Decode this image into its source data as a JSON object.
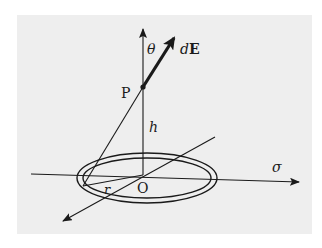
{
  "diagram": {
    "labels": {
      "point": "P",
      "origin": "O",
      "height": "h",
      "angle": "θ",
      "field_d": "d",
      "field_E": "E",
      "radius": "r",
      "charge_density": "σ"
    },
    "colors": {
      "background": "#eeeeee",
      "stroke": "#1a1a1a"
    }
  }
}
